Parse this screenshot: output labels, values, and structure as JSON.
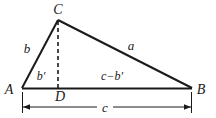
{
  "figure": {
    "background_color": "#ffffff",
    "stroke_color": "#1a1a1a",
    "vertices": {
      "A": {
        "label": "A",
        "x": 22,
        "y": 88,
        "label_x": 9,
        "label_y": 89
      },
      "B": {
        "label": "B",
        "x": 192,
        "y": 88,
        "label_x": 196,
        "label_y": 89
      },
      "C": {
        "label": "C",
        "x": 58,
        "y": 20,
        "label_x": 53,
        "label_y": 14
      },
      "D": {
        "label": "D",
        "x": 58,
        "y": 88,
        "label_x": 54,
        "label_y": 101
      }
    },
    "sides": {
      "b": {
        "label": "b",
        "x": 24,
        "y": 52
      },
      "a": {
        "label": "a",
        "x": 128,
        "y": 50
      },
      "b_prime": {
        "label": "b′",
        "x": 36,
        "y": 79
      },
      "c_minus_b_prime": {
        "label": "c−b′",
        "x": 92,
        "y": 79
      },
      "c": {
        "label": "c",
        "x": 104,
        "y": 111
      }
    },
    "dimension_line": {
      "name": "base-length-c",
      "y": 107,
      "x_start": 22,
      "x_end": 191,
      "label": "c",
      "arrow_left": "left-arrow",
      "arrow_right": "right-arrow"
    },
    "altitude": {
      "name": "altitude-CD",
      "style": "dashed",
      "from": "C",
      "to": "D"
    }
  }
}
